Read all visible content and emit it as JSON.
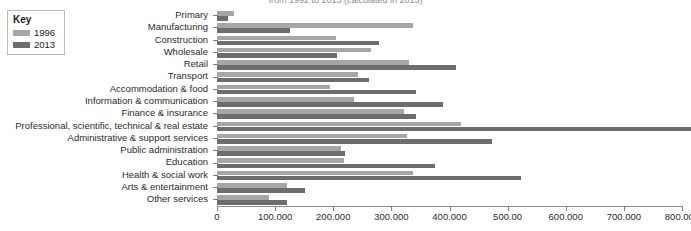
{
  "chart_data": {
    "type": "bar",
    "orientation": "horizontal",
    "title": "",
    "subtitle": "from 1992 to 2013 (calculated in 2013)",
    "xlabel": "",
    "ylabel": "",
    "xlim": [
      0,
      800000
    ],
    "xticks": [
      0,
      100000,
      200000,
      300000,
      400000,
      500000,
      600000,
      700000,
      800000
    ],
    "xtick_labels": [
      "0",
      "100.000",
      "200.000",
      "300.000",
      "400.000",
      "500.00",
      "600.000",
      "700.000",
      "800.000"
    ],
    "grid": false,
    "legend_position": "top-left",
    "categories": [
      "Primary",
      "Manufacturing",
      "Construction",
      "Wholesale",
      "Retail",
      "Transport",
      "Accommodation & food",
      "Information & communication",
      "Finance & insurance",
      "Professional, scientific, technical & real estate",
      "Administrative & support services",
      "Public administration",
      "Education",
      "Health & social work",
      "Arts & entertainment",
      "Other services"
    ],
    "series": [
      {
        "name": "1996",
        "color": "#a6a6a6",
        "values": [
          29000,
          338000,
          205000,
          265000,
          330000,
          243000,
          195000,
          235000,
          322000,
          420000,
          327000,
          213000,
          219000,
          337000,
          121000,
          90000
        ]
      },
      {
        "name": "2013",
        "color": "#6d6d6d",
        "values": [
          19000,
          125000,
          278000,
          207000,
          411000,
          261000,
          342000,
          388000,
          342000,
          815000,
          473000,
          221000,
          375000,
          523000,
          152000,
          121000
        ]
      }
    ]
  },
  "legend": {
    "title": "Key",
    "items": [
      {
        "label": "1996",
        "color": "#a6a6a6"
      },
      {
        "label": "2013",
        "color": "#6d6d6d"
      }
    ]
  }
}
